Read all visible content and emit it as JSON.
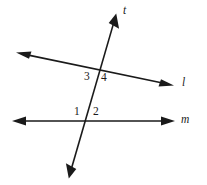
{
  "figure": {
    "background_color": "#ffffff",
    "stroke_color": "#1a1a1a",
    "lines": [
      {
        "name": "l",
        "label": "l",
        "label_x": 182,
        "label_y": 77,
        "x1": 18,
        "y1": 53,
        "x2": 172,
        "y2": 85,
        "arrow_start": true,
        "arrow_end": true
      },
      {
        "name": "m",
        "label": "m",
        "label_x": 181,
        "label_y": 114,
        "x1": 14,
        "y1": 121,
        "x2": 172,
        "y2": 121,
        "arrow_start": true,
        "arrow_end": true
      },
      {
        "name": "t",
        "label": "t",
        "label_x": 123,
        "label_y": 5,
        "x1": 69,
        "y1": 177,
        "x2": 116,
        "y2": 15,
        "arrow_start": true,
        "arrow_end": true
      }
    ],
    "intersections": [
      {
        "name": "t-and-l",
        "x": 100,
        "y": 70
      },
      {
        "name": "t-and-m",
        "x": 86,
        "y": 121
      }
    ],
    "angle_labels": [
      {
        "id": "1",
        "text": "1",
        "x": 74,
        "y": 106
      },
      {
        "id": "2",
        "text": "2",
        "x": 93,
        "y": 106
      },
      {
        "id": "3",
        "text": "3",
        "x": 84,
        "y": 71
      },
      {
        "id": "4",
        "text": "4",
        "x": 101,
        "y": 72
      }
    ]
  }
}
